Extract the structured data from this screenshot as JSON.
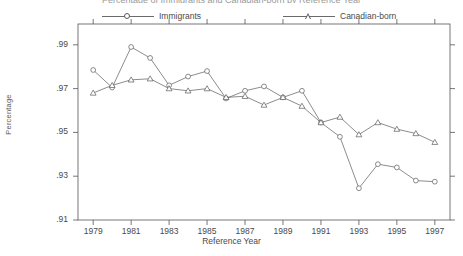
{
  "figure": {
    "top_title": "Percentage of Immigrants and Canadian-born by Reference Year",
    "xlabel": "Reference Year",
    "ylabel": "Percentage"
  },
  "legend": {
    "immigrants": "Immigrants",
    "canadian_born": "Canadian-born"
  },
  "chart_data": {
    "type": "line",
    "title": "Percentage of Immigrants and Canadian-born by Reference Year",
    "xlabel": "Reference Year",
    "ylabel": "Percentage",
    "xlim": [
      1978.2,
      1997.8
    ],
    "ylim": [
      0.91,
      0.9995
    ],
    "grid": false,
    "legend_position": "top",
    "xticks": [
      1979,
      1981,
      1983,
      1985,
      1987,
      1989,
      1991,
      1993,
      1995,
      1997
    ],
    "xtick_labels": [
      "1979",
      "1981",
      "1983",
      "1985",
      "1987",
      "1989",
      "1991",
      "1993",
      "1995",
      "1997"
    ],
    "yticks": [
      0.91,
      0.93,
      0.95,
      0.97,
      0.99
    ],
    "ytick_labels": [
      ".91",
      ".93",
      ".95",
      ".97",
      ".99"
    ],
    "x": [
      1979,
      1980,
      1981,
      1982,
      1983,
      1984,
      1985,
      1986,
      1987,
      1988,
      1989,
      1990,
      1991,
      1992,
      1993,
      1994,
      1995,
      1996,
      1997
    ],
    "series": [
      {
        "name": "Immigrants",
        "marker": "circle",
        "color": "#5a5a5a",
        "values": [
          0.9785,
          0.9705,
          0.989,
          0.984,
          0.9715,
          0.9755,
          0.978,
          0.9655,
          0.969,
          0.971,
          0.966,
          0.969,
          0.9545,
          0.948,
          0.9245,
          0.9355,
          0.934,
          0.928,
          0.9275
        ]
      },
      {
        "name": "Canadian-born",
        "marker": "triangle",
        "color": "#5a5a5a",
        "values": [
          0.968,
          0.9715,
          0.974,
          0.9745,
          0.97,
          0.969,
          0.97,
          0.966,
          0.9665,
          0.9625,
          0.966,
          0.962,
          0.9545,
          0.957,
          0.949,
          0.9545,
          0.9515,
          0.9495,
          0.9455
        ]
      }
    ]
  }
}
